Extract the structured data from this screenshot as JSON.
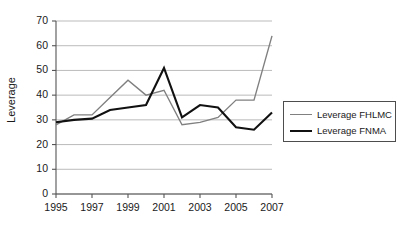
{
  "chart_data": {
    "type": "line",
    "title": "",
    "xlabel": "",
    "ylabel": "Leverage",
    "ylim": [
      0,
      70
    ],
    "ytick_step": 10,
    "yticks": [
      0,
      10,
      20,
      30,
      40,
      50,
      60,
      70
    ],
    "xlim": [
      1995,
      2007
    ],
    "x": [
      1995,
      1996,
      1997,
      1998,
      1999,
      2000,
      2001,
      2002,
      2003,
      2004,
      2005,
      2006,
      2007
    ],
    "xticks": [
      1995,
      1997,
      1999,
      2001,
      2003,
      2005,
      2007
    ],
    "xtick_labels": [
      "1995",
      "1997",
      "1999",
      "2001",
      "2003",
      "2005",
      "2007"
    ],
    "grid": "horizontal",
    "legend_position": "right",
    "series": [
      {
        "name": "Leverage FHLMC",
        "color": "#808080",
        "width": 1.4,
        "values": [
          28,
          32,
          32,
          39,
          46,
          40,
          42,
          28,
          29,
          31,
          38,
          38,
          64
        ]
      },
      {
        "name": "Leverage FNMA",
        "color": "#111111",
        "width": 2.1,
        "values": [
          29,
          30,
          30.5,
          34,
          35,
          36,
          51,
          31,
          36,
          35,
          27,
          26,
          33
        ]
      }
    ]
  },
  "axis": {
    "ytick_labels": [
      "70",
      "60",
      "50",
      "40",
      "30",
      "20",
      "10",
      "0"
    ],
    "ylabel": "Leverage"
  },
  "legend": {
    "items": [
      {
        "label": "Leverage FHLMC"
      },
      {
        "label": "Leverage FNMA"
      }
    ]
  }
}
